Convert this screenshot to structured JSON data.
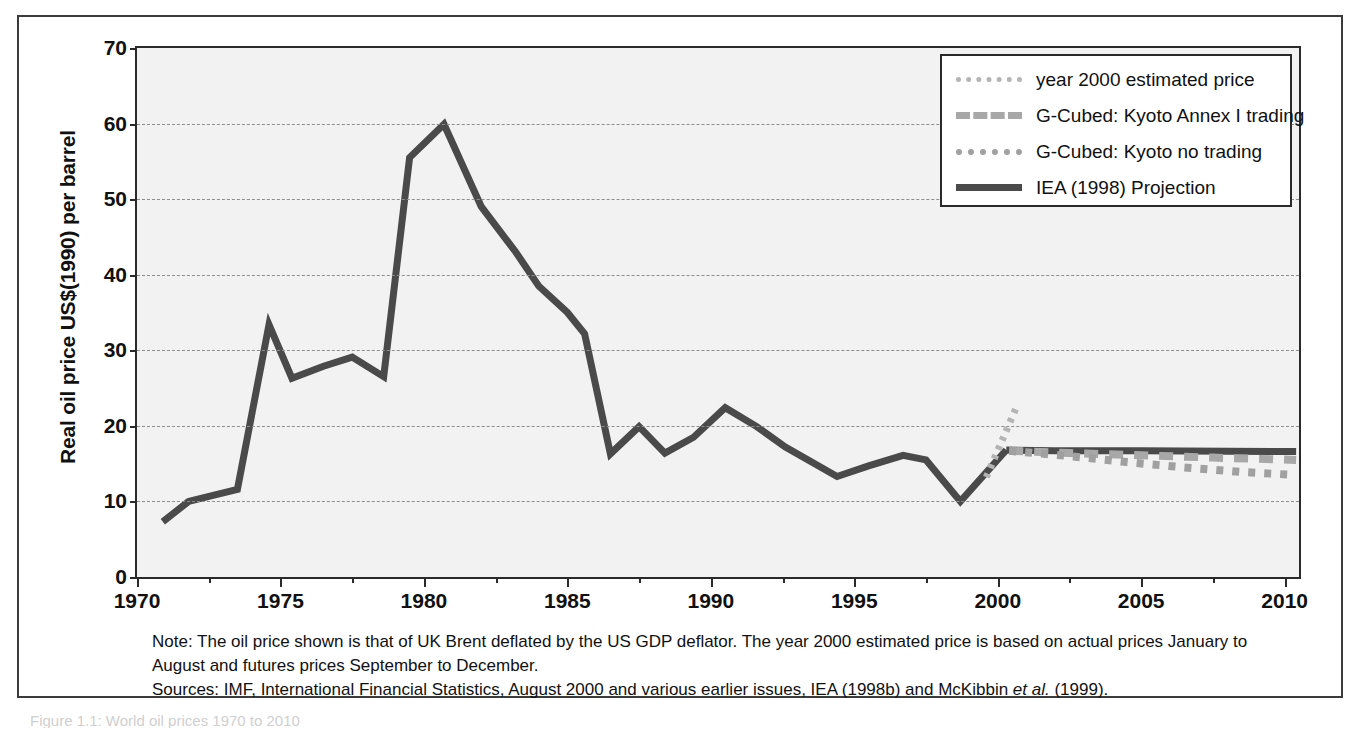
{
  "figure": {
    "y_axis_title": "Real oil price US$(1990) per barrel",
    "caption_partial": "Figure 1.1: World oil prices 1970 to 2010"
  },
  "legend": {
    "entries": [
      {
        "label": "year 2000 estimated price",
        "style": "dot-fine",
        "color": "#b4b4b4"
      },
      {
        "label": "G-Cubed: Kyoto Annex I trading",
        "style": "dash",
        "color": "#a8a8a8"
      },
      {
        "label": "G-Cubed: Kyoto no trading",
        "style": "dot-coarse",
        "color": "#a0a0a0"
      },
      {
        "label": "IEA (1998) Projection",
        "style": "solid",
        "color": "#4a4a4a"
      }
    ]
  },
  "notes": {
    "note_line": "Note: The oil price shown is that of UK Brent deflated by the US GDP deflator. The year 2000 estimated price is based on actual prices January to August and futures prices September to December.",
    "sources_prefix": "Sources: IMF, International Financial Statistics, August 2000 and various earlier issues, IEA (1998b) and McKibbin ",
    "sources_italic": "et al.",
    "sources_suffix": " (1999)."
  },
  "chart_data": {
    "type": "line",
    "title": "",
    "xlabel": "",
    "ylabel": "Real oil price US$(1990) per barrel",
    "xlim": [
      1970,
      2010.5
    ],
    "ylim": [
      0,
      70
    ],
    "ytick_values": [
      0,
      10,
      20,
      30,
      40,
      50,
      60,
      70
    ],
    "xtick_major": [
      1970,
      1975,
      1980,
      1985,
      1990,
      1995,
      2000,
      2005,
      2010
    ],
    "xtick_minor": [
      1972.5,
      1977.5,
      1982.5,
      1987.5,
      1992.5,
      1997.5,
      2002.5,
      2007.5
    ],
    "grid": "horizontal-dashed",
    "legend_position": "top-right",
    "series": [
      {
        "name": "Historical oil price",
        "style": "solid",
        "color": "#4a4a4a",
        "points": [
          [
            1970.9,
            7.3
          ],
          [
            1971.8,
            10.0
          ],
          [
            1973.5,
            11.6
          ],
          [
            1974.6,
            33.4
          ],
          [
            1975.4,
            26.3
          ],
          [
            1976.5,
            27.9
          ],
          [
            1977.5,
            29.1
          ],
          [
            1978.6,
            26.5
          ],
          [
            1979.5,
            55.5
          ],
          [
            1980.7,
            59.9
          ],
          [
            1982.0,
            49.0
          ],
          [
            1983.2,
            43.0
          ],
          [
            1984.0,
            38.5
          ],
          [
            1985.0,
            35.0
          ],
          [
            1985.6,
            32.2
          ],
          [
            1986.5,
            16.3
          ],
          [
            1987.5,
            19.9
          ],
          [
            1988.4,
            16.4
          ],
          [
            1989.4,
            18.5
          ],
          [
            1990.5,
            22.4
          ],
          [
            1991.6,
            19.9
          ],
          [
            1992.6,
            17.2
          ],
          [
            1994.4,
            13.3
          ],
          [
            1995.5,
            14.7
          ],
          [
            1996.7,
            16.1
          ],
          [
            1997.5,
            15.5
          ],
          [
            1998.7,
            10.0
          ],
          [
            2000.3,
            16.8
          ]
        ]
      },
      {
        "name": "year 2000 estimated price",
        "style": "dot-fine",
        "color": "#b4b4b4",
        "points": [
          [
            1999.6,
            13.2
          ],
          [
            2000.7,
            22.9
          ]
        ]
      },
      {
        "name": "IEA (1998) Projection",
        "style": "solid",
        "color": "#4a4a4a",
        "points": [
          [
            2000.3,
            16.8
          ],
          [
            2002.0,
            16.7
          ],
          [
            2005.0,
            16.7
          ],
          [
            2010.4,
            16.6
          ]
        ]
      },
      {
        "name": "G-Cubed: Kyoto Annex I trading",
        "style": "dash",
        "color": "#a8a8a8",
        "points": [
          [
            2000.4,
            16.7
          ],
          [
            2002.5,
            16.4
          ],
          [
            2005.0,
            16.1
          ],
          [
            2007.5,
            15.8
          ],
          [
            2010.4,
            15.5
          ]
        ]
      },
      {
        "name": "G-Cubed: Kyoto no trading",
        "style": "dot-coarse",
        "color": "#a0a0a0",
        "points": [
          [
            2000.4,
            16.7
          ],
          [
            2002.5,
            16.0
          ],
          [
            2004.5,
            15.2
          ],
          [
            2006.5,
            14.5
          ],
          [
            2008.5,
            13.9
          ],
          [
            2010.4,
            13.5
          ]
        ]
      }
    ]
  }
}
